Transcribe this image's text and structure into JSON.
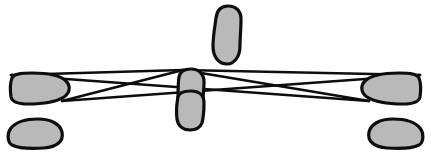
{
  "figure": {
    "width": 431,
    "height": 158,
    "background_color": "#ffffff",
    "stroke_color": "#0d0d0d",
    "fill_color": "#b9b9b9",
    "blob_stroke_width": 3.2,
    "ray_stroke_width": 2.6
  },
  "chart_data": {
    "type": "diagram",
    "xlabel": "",
    "ylabel": "",
    "grid": false,
    "legend": "none",
    "xlim": [
      0,
      431
    ],
    "ylim": [
      0,
      158
    ],
    "annotations": [],
    "ray_vertices": {
      "apex": {
        "x": 183,
        "y": 70
      },
      "left_crossing": {
        "x": 117,
        "y": 87
      },
      "right_crossing": {
        "x": 313,
        "y": 88
      },
      "left_upper_anchor": {
        "x": 11,
        "y": 75
      },
      "left_lower_anchor": {
        "x": 62,
        "y": 101
      },
      "right_upper_anchor": {
        "x": 420,
        "y": 75
      },
      "right_lower_anchor": {
        "x": 369,
        "y": 101
      }
    },
    "shapes": [
      {
        "name": "top-center-lobe",
        "orientation": "vertical",
        "bbox": {
          "x": 212,
          "y": 5,
          "w": 31,
          "h": 60
        },
        "path": "M 228 6 C 236 6 241 11 241 19 C 241 29 240 38 240 46 C 240 57 234 64 227 64 C 218 64 213 56 213 46 C 213 36 215 26 216 18 C 217 10 221 6 228 6 Z"
      },
      {
        "name": "center-upper-lobe",
        "orientation": "vertical",
        "bbox": {
          "x": 176,
          "y": 68,
          "w": 30,
          "h": 36
        },
        "path": "M 191 69 C 199 69 204 74 204 82 C 204 90 203 96 203 101 C 203 104 198 104 192 104 C 184 104 178 103 178 99 C 178 92 178 83 179 77 C 180 71 184 69 191 69 Z"
      },
      {
        "name": "center-lower-lobe",
        "orientation": "vertical",
        "bbox": {
          "x": 176,
          "y": 90,
          "w": 30,
          "h": 41
        },
        "path": "M 191 91 C 199 91 204 95 204 103 C 204 112 203 119 202 123 C 200 128 196 130 190 130 C 183 130 178 126 177 119 C 176 111 177 102 178 97 C 179 92 184 91 191 91 Z"
      },
      {
        "name": "left-upper-lobe",
        "orientation": "horizontal",
        "bbox": {
          "x": 9,
          "y": 72,
          "w": 62,
          "h": 33
        },
        "path": "M 12 78 C 14 74 20 73 32 73 C 48 73 60 75 66 81 C 71 86 70 93 64 97 C 56 102 42 104 28 104 C 18 104 12 102 11 97 C 10 90 10 83 12 78 Z"
      },
      {
        "name": "left-lower-lobe",
        "orientation": "horizontal",
        "bbox": {
          "x": 8,
          "y": 117,
          "w": 56,
          "h": 32
        },
        "path": "M 11 128 C 16 122 25 119 38 119 C 51 119 60 124 62 132 C 64 141 57 147 44 148 C 30 149 18 148 12 145 C 7 142 7 133 11 128 Z"
      },
      {
        "name": "right-upper-lobe",
        "orientation": "horizontal",
        "bbox": {
          "x": 360,
          "y": 72,
          "w": 62,
          "h": 33
        },
        "path": "M 419 78 C 417 74 411 73 399 73 C 383 73 371 75 365 81 C 360 86 361 93 367 97 C 375 102 389 104 403 104 C 413 104 419 102 420 97 C 421 90 421 83 419 78 Z"
      },
      {
        "name": "right-lower-lobe",
        "orientation": "horizontal",
        "bbox": {
          "x": 367,
          "y": 117,
          "w": 56,
          "h": 32
        },
        "path": "M 420 128 C 415 122 406 119 393 119 C 380 119 371 124 369 132 C 367 141 374 147 387 148 C 401 149 413 148 419 145 C 424 142 424 133 420 128 Z"
      }
    ],
    "rays": [
      {
        "name": "left-upper-to-apex-ray",
        "points": [
          {
            "x": 11,
            "y": 75
          },
          {
            "x": 183,
            "y": 70
          }
        ]
      },
      {
        "name": "left-lower-to-apex-ray",
        "points": [
          {
            "x": 62,
            "y": 101
          },
          {
            "x": 183,
            "y": 70
          }
        ]
      },
      {
        "name": "left-upper-long-ray",
        "points": [
          {
            "x": 11,
            "y": 75
          },
          {
            "x": 369,
            "y": 101
          }
        ]
      },
      {
        "name": "left-lower-long-ray",
        "points": [
          {
            "x": 62,
            "y": 101
          },
          {
            "x": 420,
            "y": 75
          }
        ]
      },
      {
        "name": "right-upper-to-apex-ray",
        "points": [
          {
            "x": 420,
            "y": 75
          },
          {
            "x": 183,
            "y": 70
          }
        ]
      },
      {
        "name": "right-lower-to-apex-ray",
        "points": [
          {
            "x": 369,
            "y": 101
          },
          {
            "x": 183,
            "y": 70
          }
        ]
      }
    ]
  }
}
